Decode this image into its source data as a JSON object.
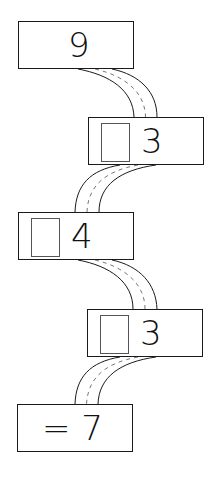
{
  "diagram": {
    "type": "number-chain-path",
    "boxes": [
      {
        "id": "start",
        "label": "9",
        "has_blank": false
      },
      {
        "id": "step1",
        "label": "3",
        "has_blank": true
      },
      {
        "id": "step2",
        "label": "4",
        "has_blank": true
      },
      {
        "id": "step3",
        "label": "3",
        "has_blank": true
      },
      {
        "id": "result",
        "label": "= 7",
        "has_blank": false
      }
    ],
    "connectors": [
      {
        "from": "start",
        "to": "step1",
        "style": "road"
      },
      {
        "from": "step1",
        "to": "step2",
        "style": "road"
      },
      {
        "from": "step2",
        "to": "step3",
        "style": "road"
      },
      {
        "from": "step3",
        "to": "result",
        "style": "road"
      }
    ],
    "colors": {
      "stroke": "#1a1a1a",
      "blank_border": "#555555",
      "background": "#ffffff"
    }
  }
}
